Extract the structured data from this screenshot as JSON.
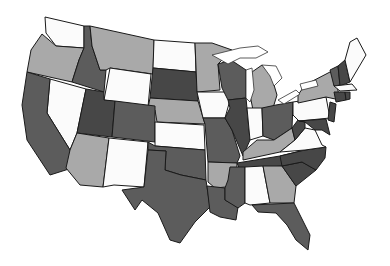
{
  "map": {
    "title": "United States map (grayscale shaded states)",
    "shades": {
      "white": "#fbfbfb",
      "light": "#a9a9a9",
      "medium": "#7d7d7d",
      "dark": "#5c5c5c",
      "darker": "#474747"
    },
    "states": [
      {
        "id": "WA",
        "name": "Washington",
        "shade": "white",
        "points": "45,17 84,26 84,48 56,46 46,33"
      },
      {
        "id": "OR",
        "name": "Oregon",
        "shade": "light",
        "points": "42,34 56,46 84,48 79,60 72,82 27,72 31,50"
      },
      {
        "id": "ID",
        "name": "Idaho",
        "shade": "dark",
        "points": "84,26 90,26 92,46 100,70 106,70 104,92 72,82 79,60 84,48"
      },
      {
        "id": "MT",
        "name": "Montana",
        "shade": "light",
        "points": "90,26 154,40 153,74 110,68 106,70 100,70 92,46"
      },
      {
        "id": "WY",
        "name": "Wyoming",
        "shade": "white",
        "points": "110,68 151,74 148,107 104,100"
      },
      {
        "id": "ND",
        "name": "North Dakota",
        "shade": "white",
        "points": "154,40 195,43 196,72 153,68"
      },
      {
        "id": "SD",
        "name": "South Dakota",
        "shade": "darker",
        "points": "153,68 196,72 198,101 150,98"
      },
      {
        "id": "NE",
        "name": "Nebraska",
        "shade": "light",
        "points": "150,98 198,101 205,124 157,122 155,110 148,108"
      },
      {
        "id": "NV",
        "name": "Nevada",
        "shade": "white",
        "points": "50,79 86,89 77,133 70,150 47,113"
      },
      {
        "id": "CA",
        "name": "California",
        "shade": "dark",
        "points": "27,72 50,79 47,113 70,150 72,168 50,175 27,140 22,105"
      },
      {
        "id": "UT",
        "name": "Utah",
        "shade": "darker",
        "points": "86,89 104,92 104,100 115,101 112,137 77,133"
      },
      {
        "id": "CO",
        "name": "Colorado",
        "shade": "dark",
        "points": "115,101 155,106 155,142 112,137"
      },
      {
        "id": "AZ",
        "name": "Arizona",
        "shade": "light",
        "points": "77,133 109,138 103,187 80,185 66,168 70,150"
      },
      {
        "id": "NM",
        "name": "New Mexico",
        "shade": "white",
        "points": "109,138 148,142 144,187 114,185 103,187"
      },
      {
        "id": "KS",
        "name": "Kansas",
        "shade": "white",
        "points": "155,122 204,125 205,150 155,146"
      },
      {
        "id": "OK",
        "name": "Oklahoma",
        "shade": "dark",
        "points": "148,142 155,146 205,150 206,180 181,175 165,170 166,151 148,150"
      },
      {
        "id": "TX",
        "name": "Texas",
        "shade": "dark",
        "points": "148,150 166,151 165,170 181,175 206,180 210,207 195,222 180,243 170,240 158,213 142,200 135,210 122,190 144,187"
      },
      {
        "id": "MN",
        "name": "Minnesota",
        "shade": "light",
        "points": "195,43 212,43 232,50 218,64 220,90 197,92"
      },
      {
        "id": "IA",
        "name": "Iowa",
        "shade": "white",
        "points": "197,92 226,92 230,100 225,118 203,118"
      },
      {
        "id": "MO",
        "name": "Missouri",
        "shade": "dark",
        "points": "203,118 225,118 232,130 240,156 237,163 208,162 205,124"
      },
      {
        "id": "WI",
        "name": "Wisconsin",
        "shade": "dark",
        "points": "218,64 231,60 246,70 246,98 228,100 222,88"
      },
      {
        "id": "IL",
        "name": "Illinois",
        "shade": "darker",
        "points": "228,100 246,98 250,140 243,156 232,130 225,118 230,108"
      },
      {
        "id": "MI",
        "name": "Michigan",
        "shade": "light",
        "points": "252,72 262,65 271,75 277,95 273,108 253,110 250,95"
      },
      {
        "id": "IN",
        "name": "Indiana",
        "shade": "white",
        "points": "247,108 262,108 263,136 250,140"
      },
      {
        "id": "OH",
        "name": "Ohio",
        "shade": "dark",
        "points": "262,108 276,105 293,102 292,128 274,140 263,136"
      },
      {
        "id": "KY",
        "name": "Kentucky",
        "shade": "light",
        "points": "243,152 257,140 274,140 292,128 295,140 280,152 243,160"
      },
      {
        "id": "TN",
        "name": "Tennessee",
        "shade": "darker",
        "points": "237,163 280,156 305,150 302,162 282,166 240,170"
      },
      {
        "id": "AR",
        "name": "Arkansas",
        "shade": "light",
        "points": "208,162 237,163 236,186 215,188 208,182"
      },
      {
        "id": "LA",
        "name": "Louisiana",
        "shade": "dark",
        "points": "207,186 225,188 225,200 238,207 236,220 220,217 210,212"
      },
      {
        "id": "MS",
        "name": "Mississippi",
        "shade": "dark",
        "points": "230,167 245,167 245,203 238,208 225,200 225,188 228,180"
      },
      {
        "id": "AL",
        "name": "Alabama",
        "shade": "white",
        "points": "245,167 263,166 270,203 250,205 245,203"
      },
      {
        "id": "GA",
        "name": "Georgia",
        "shade": "light",
        "points": "263,166 282,166 296,186 294,203 270,203"
      },
      {
        "id": "FL",
        "name": "Florida",
        "shade": "dark",
        "points": "252,205 294,203 300,215 310,235 308,250 296,240 287,225 276,213 258,212"
      },
      {
        "id": "SC",
        "name": "South Carolina",
        "shade": "darker",
        "points": "282,166 302,162 316,170 296,186"
      },
      {
        "id": "NC",
        "name": "North Carolina",
        "shade": "darker",
        "points": "280,156 305,150 326,147 325,158 316,170 302,162 282,166"
      },
      {
        "id": "VA",
        "name": "Virginia",
        "shade": "white",
        "points": "280,152 295,140 305,128 315,130 322,145 326,147 305,150"
      },
      {
        "id": "WV",
        "name": "West Virginia",
        "shade": "darker",
        "points": "292,128 298,120 305,122 305,128 295,140"
      },
      {
        "id": "PA",
        "name": "Pennsylvania",
        "shade": "white",
        "points": "293,102 326,97 330,118 299,121 293,115"
      },
      {
        "id": "NY",
        "name": "New York",
        "shade": "light",
        "points": "298,95 305,85 330,72 334,72 340,100 326,97 298,103"
      },
      {
        "id": "MD",
        "name": "Maryland",
        "shade": "darker",
        "points": "299,121 326,119 330,135 322,130 315,130 305,122"
      },
      {
        "id": "NJ",
        "name": "New Jersey",
        "shade": "darker",
        "points": "330,102 336,104 334,122 328,120"
      },
      {
        "id": "VT",
        "name": "Vermont",
        "shade": "dark",
        "points": "330,70 338,66 340,85 334,86"
      },
      {
        "id": "NH",
        "name": "New Hampshire",
        "shade": "darker",
        "points": "338,66 345,60 350,82 340,86"
      },
      {
        "id": "ME",
        "name": "Maine",
        "shade": "white",
        "points": "345,60 350,42 357,38 366,55 350,82"
      },
      {
        "id": "MA",
        "name": "Massachusetts",
        "shade": "white",
        "points": "334,86 352,84 357,90 340,91"
      },
      {
        "id": "CT",
        "name": "Connecticut",
        "shade": "darker",
        "points": "334,92 345,92 346,100 336,102"
      },
      {
        "id": "RI",
        "name": "Rhode Island",
        "shade": "darker",
        "points": "345,92 350,92 350,99 346,100"
      }
    ],
    "lakes": [
      {
        "id": "superior",
        "name": "Lake Superior",
        "points": "212,55 240,48 258,46 268,52 256,58 240,58 228,64"
      },
      {
        "id": "michigan",
        "name": "Lake Michigan",
        "points": "246,70 252,68 254,90 250,102 246,98"
      },
      {
        "id": "huron",
        "name": "Lake Huron",
        "points": "262,65 276,66 282,78 274,86 270,76"
      },
      {
        "id": "erie",
        "name": "Lake Erie",
        "points": "278,100 296,90 300,94 284,104"
      },
      {
        "id": "ontario",
        "name": "Lake Ontario",
        "points": "300,84 316,80 318,86 302,90"
      }
    ]
  }
}
